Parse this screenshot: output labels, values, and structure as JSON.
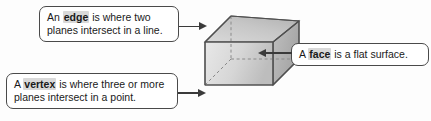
{
  "diagram": {
    "background_color": "#fdfdfd",
    "callouts": [
      {
        "id": "edge",
        "keyword": "edge",
        "text_before": "An ",
        "text_after_line1": " is where two",
        "text_line2": "planes intersect in a line.",
        "full_text": "An edge is where two planes intersect in a line.",
        "arrow_direction": "right",
        "points_to": "top-left-edge-of-cube"
      },
      {
        "id": "face",
        "keyword": "face",
        "text_before": "A ",
        "text_after_line1": " is a flat surface.",
        "text_line2": "",
        "full_text": "A face is a flat surface.",
        "arrow_direction": "left",
        "points_to": "front-face-of-cube"
      },
      {
        "id": "vertex",
        "keyword": "vertex",
        "text_before": "A ",
        "text_after_line1": " is where three or more",
        "text_line2": "planes intersect in a point.",
        "full_text": "A vertex is where three or more planes intersect in a point.",
        "arrow_direction": "right",
        "points_to": "bottom-left-vertex-of-cube"
      }
    ],
    "shape": {
      "name": "cube",
      "projection": "oblique",
      "hidden_edges_style": "dashed",
      "face_colors": {
        "front": "#d7d7d7",
        "top": "#c3c3c3",
        "right": "#b0b0b0",
        "outline": "#555555"
      }
    },
    "colors": {
      "border": "#4a4a4a",
      "text": "#1a1a1a",
      "highlight": "#d9d9d9",
      "arrow": "#3a3a3a"
    }
  }
}
